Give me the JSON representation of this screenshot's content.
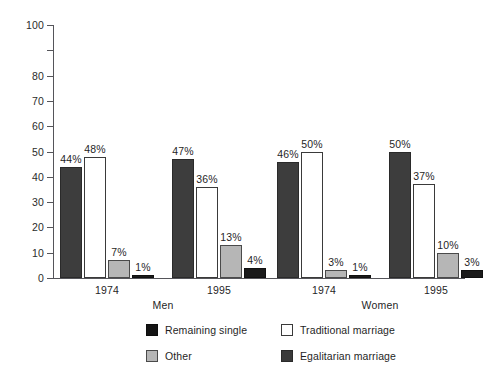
{
  "chart_data": {
    "type": "bar",
    "title": "",
    "subtitle": "",
    "xlabel": "",
    "ylabel": "",
    "ylim": [
      0,
      100
    ],
    "ytick_values": [
      0,
      10,
      20,
      30,
      40,
      50,
      60,
      70,
      80,
      100
    ],
    "ytick_labels": [
      "0",
      "10",
      "20",
      "30",
      "40",
      "50",
      "60",
      "70",
      "80",
      "100"
    ],
    "grid": false,
    "legend_position": "bottom",
    "categories": [
      "1974",
      "1995",
      "1974",
      "1995"
    ],
    "supergroups": [
      {
        "label": "Men",
        "categories": [
          "1974",
          "1995"
        ]
      },
      {
        "label": "Women",
        "categories": [
          "1974",
          "1995"
        ]
      }
    ],
    "series": [
      {
        "name": "Remaining single",
        "color": "#3d3d3d",
        "values": [
          44,
          47,
          46,
          50
        ],
        "labels": [
          "44%",
          "47%",
          "46%",
          "50%"
        ]
      },
      {
        "name": "Traditional marriage",
        "color": "#ffffff",
        "values": [
          48,
          36,
          50,
          37
        ],
        "labels": [
          "48%",
          "36%",
          "50%",
          "37%"
        ]
      },
      {
        "name": "Other",
        "color": "#b6b6b6",
        "values": [
          7,
          13,
          3,
          10
        ],
        "labels": [
          "7%",
          "13%",
          "3%",
          "10%"
        ]
      },
      {
        "name": "Egalitarian marriage",
        "color": "#1a1a1a",
        "values": [
          1,
          4,
          1,
          3
        ],
        "labels": [
          "1%",
          "4%",
          "1%",
          "3%"
        ]
      }
    ]
  },
  "axis": {
    "ticks": [
      {
        "label": "100",
        "value": 100
      },
      {
        "label": "80",
        "value": 80
      },
      {
        "label": "70",
        "value": 70
      },
      {
        "label": "60",
        "value": 60
      },
      {
        "label": "50",
        "value": 50
      },
      {
        "label": "40",
        "value": 40
      },
      {
        "label": "30",
        "value": 30
      },
      {
        "label": "20",
        "value": 20
      },
      {
        "label": "10",
        "value": 10
      },
      {
        "label": "0",
        "value": 0
      }
    ],
    "unlabeled_tick_values": [
      90
    ]
  },
  "groups": [
    {
      "year": "1974",
      "super": "Men"
    },
    {
      "year": "1995",
      "super": "Men"
    },
    {
      "year": "1974",
      "super": "Women"
    },
    {
      "year": "1995",
      "super": "Women"
    }
  ],
  "supergroup_labels": [
    {
      "label": "Men"
    },
    {
      "label": "Women"
    }
  ],
  "legend": {
    "items": [
      {
        "label": "Remaining single",
        "swatch": "s0"
      },
      {
        "label": "Traditional marriage",
        "swatch": "s1"
      },
      {
        "label": "Other",
        "swatch": "s2"
      },
      {
        "label": "Egalitarian marriage",
        "swatch": "s3"
      }
    ]
  }
}
